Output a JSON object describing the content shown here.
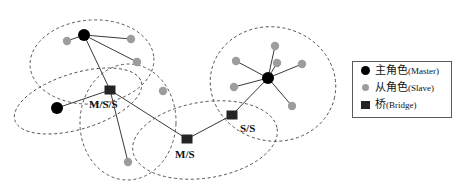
{
  "figure": {
    "type": "bluetooth-scatternet-diagram",
    "width": 458,
    "height": 196,
    "background": "#ffffff"
  },
  "colors": {
    "master": "#000000",
    "slave": "#9d9d9d",
    "bridge": "#242424",
    "link": "#3a3a3a",
    "piconet_boundary": "#4a4a4a",
    "legend_border": "#5a5a5a",
    "label_text": "#111111"
  },
  "legend": {
    "items": [
      {
        "icon": "filled-circle-black",
        "cn": "主角色",
        "en": "(Master)",
        "role": "master"
      },
      {
        "icon": "filled-circle-gray",
        "cn": "从角色",
        "en": "(Slave)",
        "role": "slave"
      },
      {
        "icon": "filled-square-black",
        "cn": "桥",
        "en": "(Bridge)",
        "role": "bridge"
      }
    ],
    "box": {
      "x": 352,
      "y": 61,
      "w": 100,
      "h": 57
    }
  },
  "piconets": [
    {
      "id": "piconet-top-left",
      "cx": 92,
      "cy": 62,
      "rx": 62,
      "ry": 42,
      "rot": -4
    },
    {
      "id": "piconet-left",
      "cx": 78,
      "cy": 101,
      "rx": 66,
      "ry": 28,
      "rot": -17
    },
    {
      "id": "piconet-center",
      "cx": 128,
      "cy": 122,
      "rx": 48,
      "ry": 58,
      "rot": 2
    },
    {
      "id": "piconet-lower-mid",
      "cx": 205,
      "cy": 140,
      "rx": 73,
      "ry": 38,
      "rot": -9
    },
    {
      "id": "piconet-right",
      "cx": 273,
      "cy": 84,
      "rx": 63,
      "ry": 57,
      "rot": 12
    }
  ],
  "nodes": [
    {
      "id": "m1",
      "type": "master",
      "x": 84,
      "y": 35,
      "label": ""
    },
    {
      "id": "s1",
      "type": "slave",
      "x": 67,
      "y": 41,
      "label": ""
    },
    {
      "id": "s2",
      "type": "slave",
      "x": 131,
      "y": 39,
      "label": ""
    },
    {
      "id": "s3",
      "type": "slave",
      "x": 137,
      "y": 62,
      "label": ""
    },
    {
      "id": "s4",
      "type": "slave",
      "x": 163,
      "y": 91,
      "label": ""
    },
    {
      "id": "m2",
      "type": "master",
      "x": 57,
      "y": 108,
      "label": ""
    },
    {
      "id": "b1",
      "type": "bridge",
      "x": 110,
      "y": 90,
      "label": "M/S/S",
      "label_x": 89,
      "label_y": 98
    },
    {
      "id": "s5",
      "type": "slave",
      "x": 128,
      "y": 162,
      "label": ""
    },
    {
      "id": "b2",
      "type": "bridge",
      "x": 187,
      "y": 139,
      "label": "M/S",
      "label_x": 175,
      "label_y": 148
    },
    {
      "id": "b3",
      "type": "bridge",
      "x": 232,
      "y": 115,
      "label": "S/S",
      "label_x": 240,
      "label_y": 122
    },
    {
      "id": "m3",
      "type": "master",
      "x": 268,
      "y": 78,
      "label": ""
    },
    {
      "id": "s6",
      "type": "slave",
      "x": 275,
      "y": 46,
      "label": ""
    },
    {
      "id": "s7",
      "type": "slave",
      "x": 236,
      "y": 61,
      "label": ""
    },
    {
      "id": "s8",
      "type": "slave",
      "x": 277,
      "y": 63,
      "label": ""
    },
    {
      "id": "s9",
      "type": "slave",
      "x": 302,
      "y": 64,
      "label": ""
    },
    {
      "id": "s10",
      "type": "slave",
      "x": 234,
      "y": 87,
      "label": ""
    },
    {
      "id": "s11",
      "type": "slave",
      "x": 292,
      "y": 106,
      "label": ""
    }
  ],
  "links": [
    {
      "from": "m1",
      "to": "s1"
    },
    {
      "from": "m1",
      "to": "s2"
    },
    {
      "from": "m1",
      "to": "s3"
    },
    {
      "from": "m1",
      "to": "b1"
    },
    {
      "from": "m2",
      "to": "b1"
    },
    {
      "from": "b1",
      "to": "s5"
    },
    {
      "from": "b1",
      "to": "b2"
    },
    {
      "from": "b2",
      "to": "b3"
    },
    {
      "from": "b3",
      "to": "m3"
    },
    {
      "from": "m3",
      "to": "s6"
    },
    {
      "from": "m3",
      "to": "s7"
    },
    {
      "from": "m3",
      "to": "s8"
    },
    {
      "from": "m3",
      "to": "s9"
    },
    {
      "from": "m3",
      "to": "s10"
    },
    {
      "from": "m3",
      "to": "s11"
    }
  ],
  "node_style": {
    "master_r": 6,
    "slave_r": 4.2,
    "bridge_w": 11,
    "bridge_h": 9
  }
}
